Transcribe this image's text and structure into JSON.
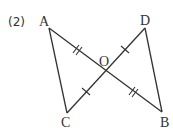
{
  "problem_number": "(2)",
  "points": {
    "A": {
      "label": "A",
      "x": 49,
      "y": 28
    },
    "B": {
      "label": "B",
      "x": 162,
      "y": 112
    },
    "C": {
      "label": "C",
      "x": 67,
      "y": 113
    },
    "D": {
      "label": "D",
      "x": 145,
      "y": 28
    },
    "O": {
      "label": "O",
      "x": 106,
      "y": 70
    }
  },
  "segments": [
    "AB",
    "CD",
    "AC",
    "DB"
  ],
  "equal_marks": {
    "double": [
      "AO",
      "OB"
    ],
    "single": [
      "CO",
      "OD"
    ]
  },
  "colors": {
    "stroke": "#333333",
    "background": "#ffffff"
  }
}
